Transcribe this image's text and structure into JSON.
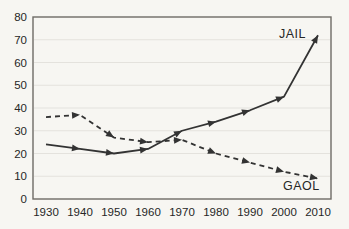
{
  "chart_data": {
    "type": "line",
    "title": "",
    "xlabel": "",
    "ylabel": "",
    "x": [
      1930,
      1940,
      1950,
      1960,
      1970,
      1980,
      1990,
      2000,
      2010
    ],
    "series": [
      {
        "name": "JAIL",
        "style": "solid",
        "values": [
          24,
          22,
          20,
          22,
          30,
          34,
          39,
          45,
          72
        ]
      },
      {
        "name": "GAOL",
        "style": "dashed",
        "values": [
          36,
          37,
          27,
          25,
          26,
          20,
          16,
          12,
          9
        ]
      }
    ],
    "ylim": [
      0,
      80
    ],
    "yticks": [
      0,
      10,
      20,
      30,
      40,
      50,
      60,
      70,
      80
    ],
    "grid": "horizontal",
    "legend": "inline-annotations",
    "marker": "arrowhead-along-direction"
  },
  "colors": {
    "background": "#f7f6f2",
    "line": "#333333",
    "grid": "#e4e2dd",
    "border": "#6e6b66",
    "text": "#262626"
  }
}
